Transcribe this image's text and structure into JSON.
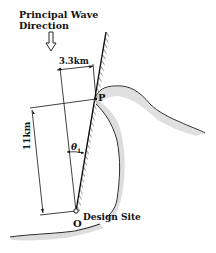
{
  "diagram": {
    "title_line1": "Principal Wave",
    "title_line2": "Direction",
    "dimension_horizontal": "3.3km",
    "dimension_vertical": "11km",
    "angle_label": "θ",
    "angle_subscript": "1",
    "point_p": "P",
    "point_o": "O",
    "design_site_label": "Design Site",
    "colors": {
      "ink": "#111111",
      "stipple": "#8a8a8a",
      "background": "#ffffff"
    }
  }
}
